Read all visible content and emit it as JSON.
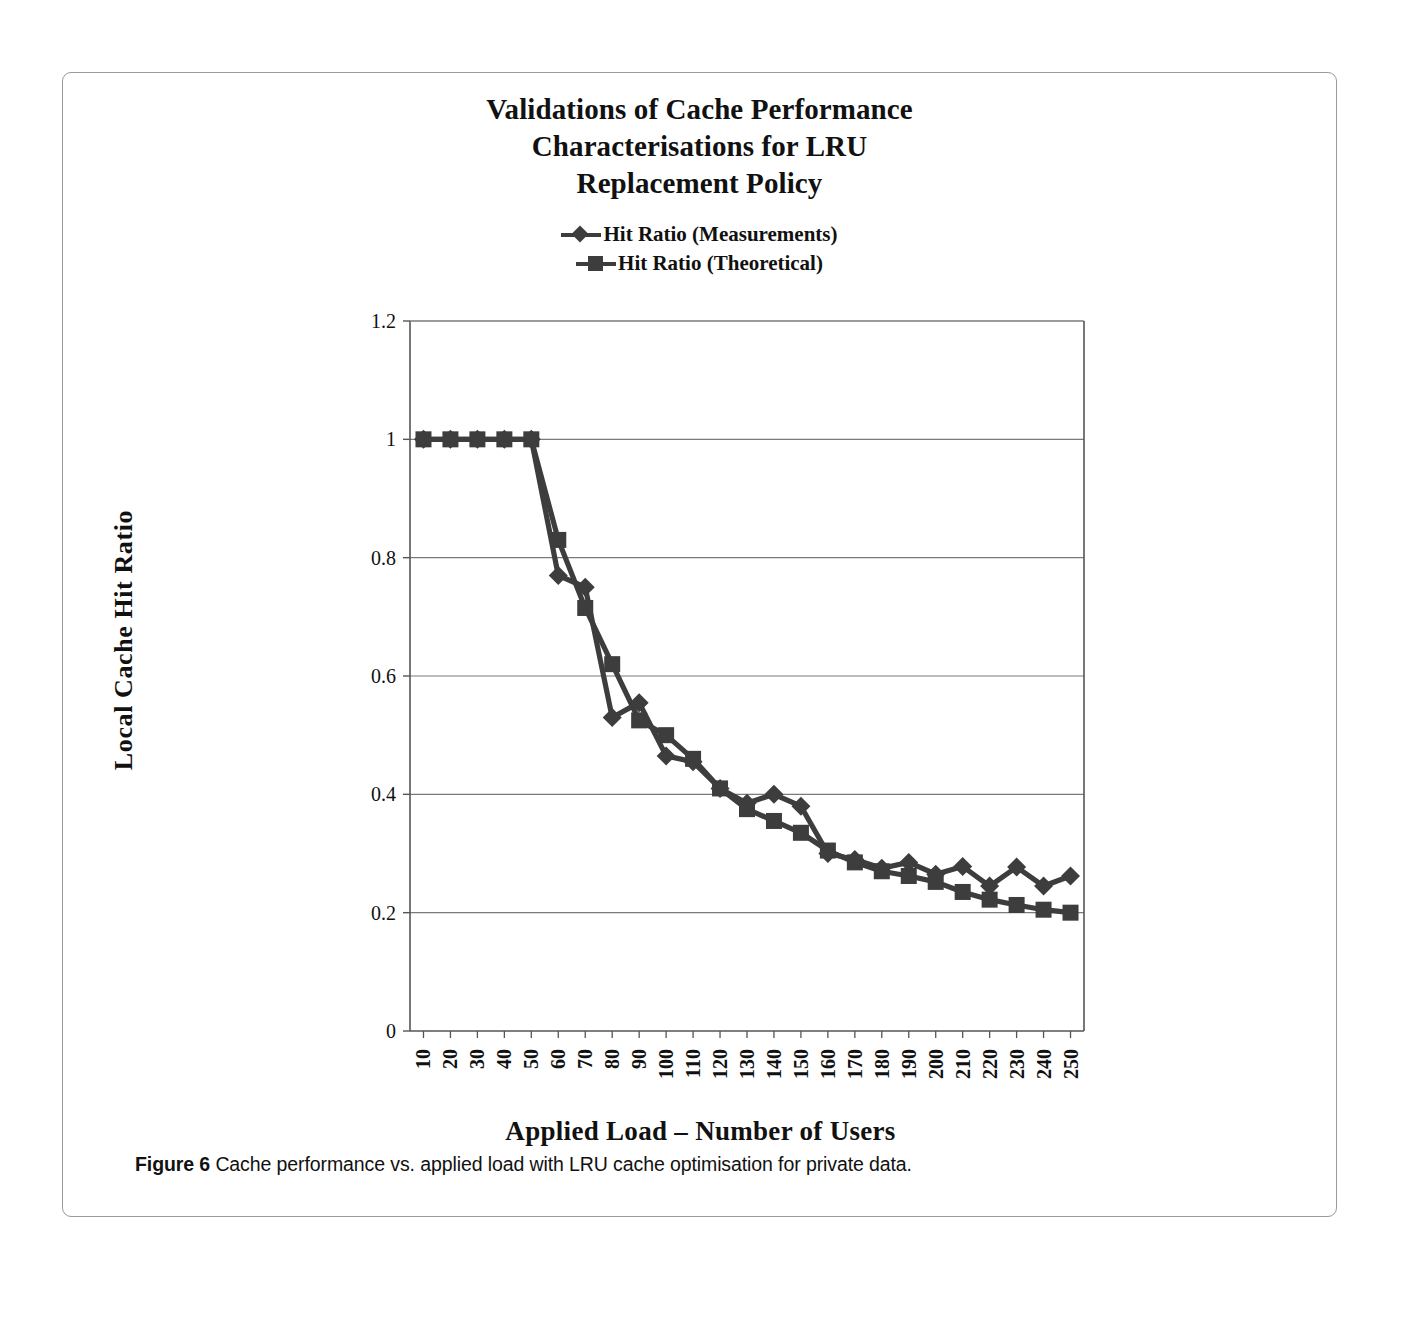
{
  "figure": {
    "title_lines": [
      "Validations of Cache Performance",
      "Characterisations for LRU",
      "Replacement Policy"
    ],
    "caption_label": "Figure 6",
    "caption_text": " Cache performance vs. applied load with LRU cache optimisation for private data.",
    "series_color": "#3d3d3d",
    "axis_color": "#555555",
    "grid_color": "#7a7a7a"
  },
  "chart_data": {
    "type": "line",
    "title": "Validations of Cache Performance Characterisations for LRU Replacement Policy",
    "xlabel": "Applied Load – Number of Users",
    "ylabel": "Local Cache Hit Ratio",
    "grid": true,
    "legend_position": "top",
    "ylim": [
      0,
      1.2
    ],
    "yticks": [
      "0",
      "0.2",
      "0.4",
      "0.6",
      "0.8",
      "1",
      "1.2"
    ],
    "ytick_values": [
      0,
      0.2,
      0.4,
      0.6,
      0.8,
      1,
      1.2
    ],
    "categories": [
      10,
      20,
      30,
      40,
      50,
      60,
      70,
      80,
      90,
      100,
      110,
      120,
      130,
      140,
      150,
      160,
      170,
      180,
      190,
      200,
      210,
      220,
      230,
      240,
      250
    ],
    "xtick_labels": [
      "10",
      "20",
      "30",
      "40",
      "50",
      "60",
      "70",
      "80",
      "90",
      "100",
      "110",
      "120",
      "130",
      "140",
      "150",
      "160",
      "170",
      "180",
      "190",
      "200",
      "210",
      "220",
      "230",
      "240",
      "250"
    ],
    "series": [
      {
        "name": "Hit Ratio (Measurements)",
        "marker": "diamond",
        "values": [
          1.0,
          1.0,
          1.0,
          1.0,
          1.0,
          0.77,
          0.75,
          0.53,
          0.555,
          0.465,
          0.455,
          0.41,
          0.385,
          0.4,
          0.38,
          0.3,
          0.29,
          0.275,
          0.285,
          0.265,
          0.278,
          0.245,
          0.277,
          0.245,
          0.262
        ]
      },
      {
        "name": "Hit Ratio (Theoretical)",
        "marker": "square",
        "values": [
          1.0,
          1.0,
          1.0,
          1.0,
          1.0,
          0.83,
          0.715,
          0.62,
          0.525,
          0.5,
          0.46,
          0.41,
          0.375,
          0.355,
          0.335,
          0.305,
          0.285,
          0.27,
          0.262,
          0.252,
          0.235,
          0.222,
          0.213,
          0.205,
          0.2
        ]
      }
    ]
  }
}
